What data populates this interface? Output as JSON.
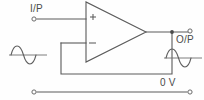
{
  "diagram": {
    "background_color": "#fefefe",
    "line_color": "#5a5a5a",
    "labels": {
      "input": "I/P",
      "output": "O/P",
      "ground": "0 V",
      "noninverting_sign": "+",
      "inverting_sign": "−"
    },
    "components": {
      "opamp": {
        "name": "operational-amplifier",
        "shape": "triangle",
        "apex_x": 146,
        "apex_y": 32,
        "left_edge_x": 86,
        "top_y": 2,
        "bottom_y": 62,
        "noninverting_input_y": 17,
        "inverting_input_y": 43
      },
      "terminals": [
        {
          "name": "input-terminal",
          "x": 34,
          "y": 19
        },
        {
          "name": "output-terminal",
          "x": 190,
          "y": 31
        },
        {
          "name": "ground-left-terminal",
          "x": 34,
          "y": 92
        },
        {
          "name": "ground-right-terminal",
          "x": 190,
          "y": 92
        }
      ],
      "junction": {
        "name": "output-node",
        "x": 172,
        "y": 32
      },
      "feedback_path": {
        "name": "feedback-wire",
        "from": "inverting-input",
        "to": "output-node",
        "left_x": 61,
        "bottom_y": 74,
        "right_x": 172
      }
    },
    "waveforms": [
      {
        "name": "input-sine-wave",
        "x": 10,
        "y": 45,
        "width": 36,
        "height": 20,
        "cycles": 1,
        "phase": "positive-first"
      },
      {
        "name": "output-sine-wave",
        "x": 165,
        "y": 48,
        "width": 36,
        "height": 20,
        "cycles": 1,
        "phase": "positive-first"
      }
    ]
  }
}
